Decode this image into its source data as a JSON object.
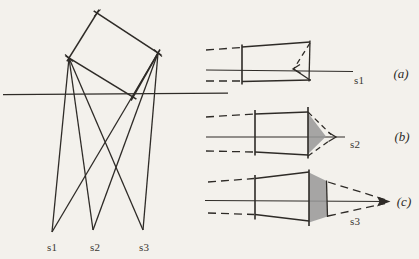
{
  "colors": {
    "paper": "#f3f1ec",
    "ink": "#2e2b27",
    "shade": "#989898",
    "label_text": "#3a3732"
  },
  "left_diagram": {
    "sources": [
      {
        "label": "s1"
      },
      {
        "label": "s2"
      },
      {
        "label": "s3"
      }
    ]
  },
  "panels": [
    {
      "letter": "(a)",
      "source_label": "s1"
    },
    {
      "letter": "(b)",
      "source_label": "s2"
    },
    {
      "letter": "(c)",
      "source_label": "s3"
    }
  ]
}
